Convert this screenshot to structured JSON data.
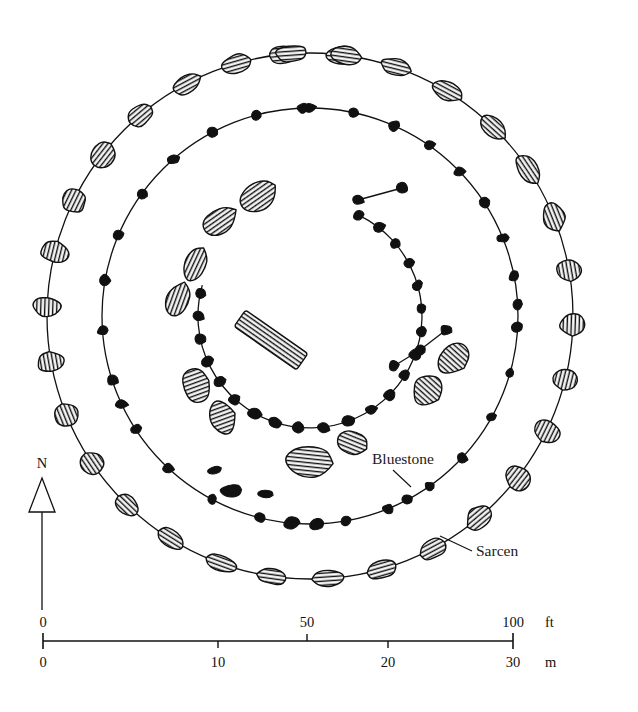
{
  "figure": {
    "kind": "archaeological-site-plan",
    "background_color": "#ffffff",
    "ink_color": "#111111",
    "sarsen_fill": "#ffffff",
    "sarsen_hatch_color": "#111111",
    "bluestone_fill": "#111111"
  },
  "annotations": {
    "bluestone": {
      "label": "Bluestone",
      "text_x": 372,
      "text_y": 464,
      "leader": {
        "x1": 393,
        "y1": 470,
        "x2": 411,
        "y2": 487
      }
    },
    "sarcen": {
      "label": "Sarcen",
      "text_x": 476,
      "text_y": 556,
      "leader": {
        "x1": 472,
        "y1": 551,
        "x2": 440,
        "y2": 536
      }
    }
  },
  "north_arrow": {
    "label": "N",
    "label_x": 42,
    "label_y": 468,
    "triangle_apex_x": 42,
    "triangle_apex_y": 478,
    "triangle_base_y": 512,
    "triangle_half_width": 13,
    "shaft_x": 42,
    "shaft_top": 512,
    "shaft_bottom": 610
  },
  "scale_bar": {
    "axis_y": 641,
    "x_start": 43,
    "x_end": 513,
    "feet": {
      "unit": "ft",
      "unit_x": 545,
      "unit_y": 627,
      "ticks": [
        {
          "label": "0",
          "x": 43,
          "major": true
        },
        {
          "label": "50",
          "x": 307,
          "major": true
        },
        {
          "label": "100",
          "x": 513,
          "major": true
        }
      ],
      "label_y": 627
    },
    "metres": {
      "unit": "m",
      "unit_x": 545,
      "unit_y": 667,
      "ticks": [
        {
          "label": "0",
          "x": 43,
          "major": true
        },
        {
          "label": "10",
          "x": 218,
          "major": true
        },
        {
          "label": "20",
          "x": 388,
          "major": true
        },
        {
          "label": "30",
          "x": 513,
          "major": true
        }
      ],
      "label_y": 667
    }
  },
  "chart_data": {
    "type": "scatter",
    "xlabel": "",
    "ylabel": "",
    "legend": [
      "Sarcen",
      "Bluestone"
    ],
    "center": {
      "x": 310,
      "y": 316
    },
    "rings": [
      {
        "name": "sarsen-circle",
        "radius": 263,
        "stroke": "#111111"
      },
      {
        "name": "bluestone-circle",
        "radius": 208,
        "stroke": "#111111"
      },
      {
        "name": "bluestone-horseshoe-arc",
        "radius": 112,
        "stroke": "#111111",
        "arc_start_deg": -64,
        "arc_end_deg": 196
      }
    ],
    "sarsen_circle_stones": [
      {
        "a": -96,
        "r": 263,
        "w": 31,
        "h": 17,
        "rot": -6
      },
      {
        "a": -83,
        "r": 263,
        "w": 36,
        "h": 18,
        "rot": 4
      },
      {
        "a": -71,
        "r": 263,
        "w": 31,
        "h": 18,
        "rot": 14
      },
      {
        "a": -59,
        "r": 263,
        "w": 34,
        "h": 19,
        "rot": 28
      },
      {
        "a": -46,
        "r": 263,
        "w": 31,
        "h": 19,
        "rot": 42
      },
      {
        "a": -34,
        "r": 263,
        "w": 31,
        "h": 21,
        "rot": 56
      },
      {
        "a": -22,
        "r": 263,
        "w": 29,
        "h": 22,
        "rot": 68
      },
      {
        "a": -10,
        "r": 263,
        "w": 25,
        "h": 25,
        "rot": 80
      },
      {
        "a": 2,
        "r": 263,
        "w": 22,
        "h": 28,
        "rot": 92
      },
      {
        "a": 14,
        "r": 263,
        "w": 21,
        "h": 28,
        "rot": 104
      },
      {
        "a": 26,
        "r": 263,
        "w": 22,
        "h": 28,
        "rot": 116
      },
      {
        "a": 38,
        "r": 263,
        "w": 25,
        "h": 26,
        "rot": 128
      },
      {
        "a": 50,
        "r": 263,
        "w": 27,
        "h": 24,
        "rot": 140
      },
      {
        "a": 62,
        "r": 263,
        "w": 30,
        "h": 21,
        "rot": 152
      },
      {
        "a": 74,
        "r": 263,
        "w": 32,
        "h": 19,
        "rot": 164
      },
      {
        "a": 86,
        "r": 263,
        "w": 34,
        "h": 18,
        "rot": 176
      },
      {
        "a": 98,
        "r": 263,
        "w": 30,
        "h": 17,
        "rot": 188
      },
      {
        "a": 110,
        "r": 263,
        "w": 33,
        "h": 18,
        "rot": 200
      },
      {
        "a": 122,
        "r": 263,
        "w": 30,
        "h": 19,
        "rot": 212
      },
      {
        "a": 134,
        "r": 263,
        "w": 28,
        "h": 21,
        "rot": 224
      },
      {
        "a": 146,
        "r": 263,
        "w": 26,
        "h": 23,
        "rot": 236
      },
      {
        "a": 158,
        "r": 263,
        "w": 23,
        "h": 26,
        "rot": 248
      },
      {
        "a": 170,
        "r": 263,
        "w": 21,
        "h": 28,
        "rot": 260
      },
      {
        "a": 182,
        "r": 263,
        "w": 21,
        "h": 29,
        "rot": 272
      },
      {
        "a": 194,
        "r": 263,
        "w": 22,
        "h": 28,
        "rot": 284
      },
      {
        "a": 206,
        "r": 263,
        "w": 24,
        "h": 26,
        "rot": 296
      },
      {
        "a": 218,
        "r": 263,
        "w": 27,
        "h": 24,
        "rot": 308
      },
      {
        "a": 230,
        "r": 263,
        "w": 29,
        "h": 21,
        "rot": 320
      },
      {
        "a": 242,
        "r": 263,
        "w": 31,
        "h": 19,
        "rot": 332
      },
      {
        "a": 254,
        "r": 263,
        "w": 32,
        "h": 18,
        "rot": 344
      },
      {
        "a": 266,
        "r": 263,
        "w": 33,
        "h": 17,
        "rot": 356
      },
      {
        "a": 278,
        "r": 263,
        "w": 30,
        "h": 18,
        "rot": 8
      }
    ],
    "bluestone_circle_stones": [
      {
        "a": -90,
        "r": 208,
        "w": 13,
        "h": 10
      },
      {
        "a": -78,
        "r": 208,
        "w": 11,
        "h": 9
      },
      {
        "a": -66,
        "r": 208,
        "w": 12,
        "h": 11
      },
      {
        "a": -55,
        "r": 208,
        "w": 11,
        "h": 9
      },
      {
        "a": -44,
        "r": 208,
        "w": 12,
        "h": 10
      },
      {
        "a": -33,
        "r": 208,
        "w": 11,
        "h": 11
      },
      {
        "a": -22,
        "r": 208,
        "w": 11,
        "h": 10
      },
      {
        "a": -11,
        "r": 208,
        "w": 11,
        "h": 11
      },
      {
        "a": -3,
        "r": 208,
        "w": 12,
        "h": 11
      },
      {
        "a": 3,
        "r": 208,
        "w": 12,
        "h": 11
      },
      {
        "a": 16,
        "r": 208,
        "w": 10,
        "h": 10
      },
      {
        "a": 29,
        "r": 208,
        "w": 10,
        "h": 9
      },
      {
        "a": 43,
        "r": 208,
        "w": 11,
        "h": 10
      },
      {
        "a": 55,
        "r": 208,
        "w": 10,
        "h": 10
      },
      {
        "a": 62,
        "r": 208,
        "w": 12,
        "h": 11
      },
      {
        "a": 68,
        "r": 208,
        "w": 12,
        "h": 11
      },
      {
        "a": 80,
        "r": 208,
        "w": 12,
        "h": 10
      },
      {
        "a": 88,
        "r": 208,
        "w": 15,
        "h": 11
      },
      {
        "a": 95,
        "r": 208,
        "w": 18,
        "h": 12
      },
      {
        "a": 104,
        "r": 208,
        "w": 13,
        "h": 10
      },
      {
        "a": 118,
        "r": 208,
        "w": 11,
        "h": 10
      },
      {
        "a": 133,
        "r": 208,
        "w": 11,
        "h": 10
      },
      {
        "a": 147,
        "r": 208,
        "w": 11,
        "h": 10
      },
      {
        "a": 155,
        "r": 208,
        "w": 12,
        "h": 11
      },
      {
        "a": 162,
        "r": 208,
        "w": 12,
        "h": 11
      },
      {
        "a": 176,
        "r": 208,
        "w": 11,
        "h": 10
      },
      {
        "a": 190,
        "r": 208,
        "w": 11,
        "h": 11
      },
      {
        "a": 203,
        "r": 208,
        "w": 11,
        "h": 10
      },
      {
        "a": 216,
        "r": 208,
        "w": 11,
        "h": 10
      },
      {
        "a": 229,
        "r": 208,
        "w": 12,
        "h": 11
      },
      {
        "a": 242,
        "r": 208,
        "w": 11,
        "h": 10
      },
      {
        "a": 255,
        "r": 208,
        "w": 11,
        "h": 10
      },
      {
        "a": 268,
        "r": 208,
        "w": 12,
        "h": 11
      }
    ],
    "bluestone_horseshoe_stones": [
      {
        "a": -64,
        "r": 112,
        "w": 12,
        "h": 10
      },
      {
        "a": -52,
        "r": 112,
        "w": 12,
        "h": 11
      },
      {
        "a": -40,
        "r": 112,
        "w": 11,
        "h": 10
      },
      {
        "a": -28,
        "r": 112,
        "w": 12,
        "h": 10
      },
      {
        "a": -16,
        "r": 112,
        "w": 11,
        "h": 10
      },
      {
        "a": -4,
        "r": 112,
        "w": 11,
        "h": 10
      },
      {
        "a": 8,
        "r": 112,
        "w": 12,
        "h": 11
      },
      {
        "a": 20,
        "r": 112,
        "w": 12,
        "h": 11
      },
      {
        "a": 32,
        "r": 112,
        "w": 12,
        "h": 10
      },
      {
        "a": 45,
        "r": 112,
        "w": 13,
        "h": 11
      },
      {
        "a": 57,
        "r": 112,
        "w": 12,
        "h": 11
      },
      {
        "a": 70,
        "r": 112,
        "w": 13,
        "h": 11
      },
      {
        "a": 83,
        "r": 112,
        "w": 12,
        "h": 11
      },
      {
        "a": 96,
        "r": 112,
        "w": 14,
        "h": 12
      },
      {
        "a": 108,
        "r": 112,
        "w": 13,
        "h": 11
      },
      {
        "a": 120,
        "r": 112,
        "w": 14,
        "h": 12
      },
      {
        "a": 132,
        "r": 112,
        "w": 13,
        "h": 11
      },
      {
        "a": 144,
        "r": 112,
        "w": 13,
        "h": 11
      },
      {
        "a": 156,
        "r": 112,
        "w": 12,
        "h": 11
      },
      {
        "a": 168,
        "r": 112,
        "w": 12,
        "h": 11
      },
      {
        "a": 180,
        "r": 112,
        "w": 12,
        "h": 11
      },
      {
        "a": 192,
        "r": 112,
        "w": 12,
        "h": 11
      }
    ],
    "horseshoe_tail_bluestones": [
      {
        "x": 402,
        "y": 188,
        "w": 13,
        "h": 11
      },
      {
        "x": 358,
        "y": 200,
        "w": 12,
        "h": 10
      },
      {
        "x": 446,
        "y": 330,
        "w": 13,
        "h": 11
      },
      {
        "x": 420,
        "y": 350,
        "w": 12,
        "h": 11
      },
      {
        "x": 394,
        "y": 366,
        "w": 12,
        "h": 11
      }
    ],
    "fallen_bluestones": [
      {
        "x": 215,
        "y": 470,
        "w": 15,
        "h": 8,
        "rot": -20
      },
      {
        "x": 231,
        "y": 491,
        "w": 25,
        "h": 14,
        "rot": -8
      },
      {
        "x": 265,
        "y": 494,
        "w": 18,
        "h": 9,
        "rot": 10
      }
    ],
    "trilithon_sarsens": [
      {
        "x": 258,
        "y": 197,
        "w": 44,
        "h": 28,
        "rot": -35
      },
      {
        "x": 220,
        "y": 221,
        "w": 38,
        "h": 26,
        "rot": -35
      },
      {
        "x": 196,
        "y": 264,
        "w": 36,
        "h": 23,
        "rot": -65
      },
      {
        "x": 178,
        "y": 300,
        "w": 36,
        "h": 24,
        "rot": -70
      },
      {
        "x": 196,
        "y": 385,
        "w": 28,
        "h": 37,
        "rot": -20
      },
      {
        "x": 222,
        "y": 418,
        "w": 26,
        "h": 36,
        "rot": -20
      },
      {
        "x": 308,
        "y": 461,
        "w": 48,
        "h": 34,
        "rot": 6
      },
      {
        "x": 352,
        "y": 443,
        "w": 32,
        "h": 26,
        "rot": 22
      },
      {
        "x": 428,
        "y": 390,
        "w": 30,
        "h": 34,
        "rot": 42
      },
      {
        "x": 453,
        "y": 358,
        "w": 28,
        "h": 36,
        "rot": 42
      }
    ],
    "altar_stone": {
      "x": 271,
      "y": 340,
      "w": 76,
      "h": 20,
      "rot": 35
    }
  }
}
